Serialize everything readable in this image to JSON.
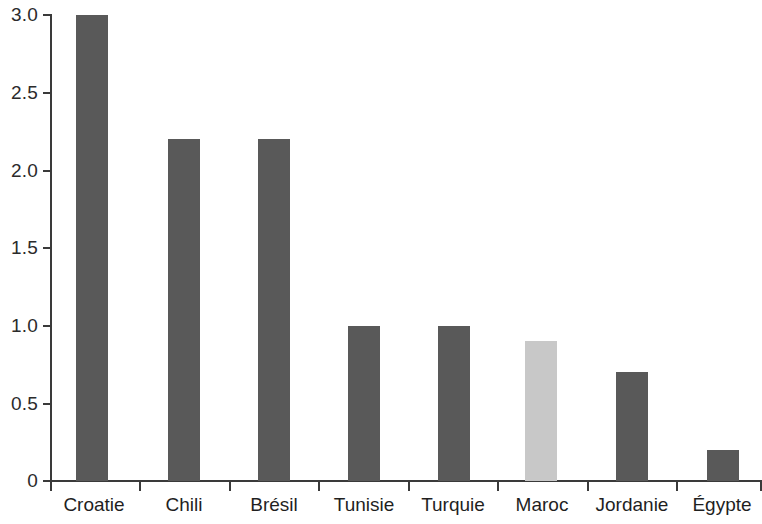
{
  "chart_data": {
    "type": "bar",
    "title": "",
    "subtitle": "",
    "xlabel": "",
    "ylabel": "",
    "categories": [
      "Croatie",
      "Chili",
      "Brésil",
      "Tunisie",
      "Turquie",
      "Maroc",
      "Jordanie",
      "Égypte"
    ],
    "values": [
      3.0,
      2.2,
      2.2,
      1.0,
      1.0,
      0.9,
      0.7,
      0.2
    ],
    "ylim": [
      0,
      3.0
    ],
    "ytick_values": [
      0,
      0.5,
      1.0,
      1.5,
      2.0,
      2.5,
      3.0
    ],
    "ytick_labels": [
      "0",
      "0.5",
      "1.0",
      "1.5",
      "2.0",
      "2.5",
      "3.0"
    ],
    "grid": false,
    "legend": null,
    "legend_position": "none",
    "bar_colors": [
      "#595959",
      "#595959",
      "#595959",
      "#595959",
      "#595959",
      "#c8c8c8",
      "#595959",
      "#595959"
    ],
    "highlighted_category": "Maroc",
    "colors": {
      "bar_default": "#595959",
      "bar_highlight": "#c8c8c8",
      "axis": "#3a3a3a",
      "text": "#1f1f1f",
      "background": "#ffffff"
    }
  }
}
